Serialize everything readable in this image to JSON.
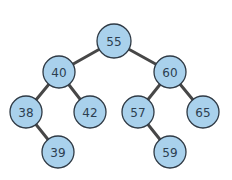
{
  "diagram": {
    "type": "binary-search-tree",
    "colors": {
      "node_fill": "#a9d1ec",
      "node_stroke": "#2f3a45",
      "edge": "#474747",
      "label": "#2c3e50"
    },
    "nodes": [
      {
        "id": "n55",
        "label": "55",
        "cx": 114,
        "cy": 41,
        "r": 17
      },
      {
        "id": "n40",
        "label": "40",
        "cx": 59,
        "cy": 72,
        "r": 16
      },
      {
        "id": "n60",
        "label": "60",
        "cx": 170,
        "cy": 72,
        "r": 16
      },
      {
        "id": "n38",
        "label": "38",
        "cx": 26,
        "cy": 112,
        "r": 16
      },
      {
        "id": "n42",
        "label": "42",
        "cx": 90,
        "cy": 112,
        "r": 16
      },
      {
        "id": "n57",
        "label": "57",
        "cx": 138,
        "cy": 112,
        "r": 16
      },
      {
        "id": "n65",
        "label": "65",
        "cx": 203,
        "cy": 112,
        "r": 16
      },
      {
        "id": "n39",
        "label": "39",
        "cx": 58,
        "cy": 152,
        "r": 16
      },
      {
        "id": "n59",
        "label": "59",
        "cx": 170,
        "cy": 152,
        "r": 16
      }
    ],
    "edges": [
      {
        "from": "n55",
        "to": "n40"
      },
      {
        "from": "n55",
        "to": "n60"
      },
      {
        "from": "n40",
        "to": "n38"
      },
      {
        "from": "n40",
        "to": "n42"
      },
      {
        "from": "n60",
        "to": "n57"
      },
      {
        "from": "n60",
        "to": "n65"
      },
      {
        "from": "n38",
        "to": "n39"
      },
      {
        "from": "n57",
        "to": "n59"
      }
    ]
  }
}
